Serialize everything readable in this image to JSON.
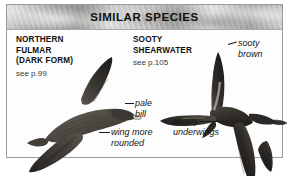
{
  "panel": {
    "title": "SIMILAR SPECIES",
    "border_color": "#9a9a9a",
    "background_color": "#fdfdfd",
    "header_band_color": "#b9b9b6"
  },
  "species": [
    {
      "id": "northern-fulmar",
      "name_lines": [
        "NORTHERN",
        "FULMAR",
        "(DARK FORM)"
      ],
      "name_line_1": "NORTHERN",
      "name_line_2": "FULMAR",
      "name_line_3": "(DARK FORM)",
      "reference": "see p.99",
      "page_number": 99
    },
    {
      "id": "sooty-shearwater",
      "name_lines": [
        "SOOTY",
        "SHEARWATER"
      ],
      "name_line_1": "SOOTY",
      "name_line_2": "SHEARWATER",
      "reference": "see p.105",
      "page_number": 105
    }
  ],
  "callouts": [
    {
      "id": "pale-bill",
      "line_1": "pale",
      "line_2": "bill",
      "target": "northern-fulmar"
    },
    {
      "id": "wing-more-rounded",
      "line_1": "wing more",
      "line_2": "rounded",
      "target": "northern-fulmar"
    },
    {
      "id": "sooty-brown",
      "line_1": "sooty",
      "line_2": "brown",
      "target": "sooty-shearwater"
    },
    {
      "id": "silvery-underwings",
      "line_1": "silvery",
      "line_2": "underwings",
      "target": "sooty-shearwater"
    }
  ],
  "illustrations": [
    {
      "id": "fulmar-illustration",
      "subject": "Northern Fulmar (dark form) in flight, viewed from above, facing right, one wing raised",
      "plumage_color": "#4a453f"
    },
    {
      "id": "shearwater-illustration",
      "subject": "Sooty Shearwater in flight, wings spread in cross shape, facing right",
      "plumage_color": "#2e2b28"
    }
  ]
}
